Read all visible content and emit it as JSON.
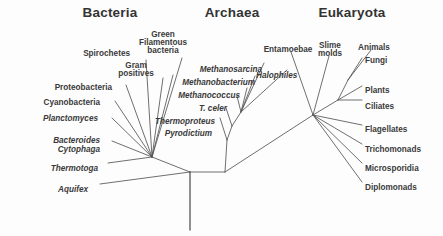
{
  "figure": {
    "kind": "phylogenetic-tree",
    "title_absent": true,
    "line_color": "#555555",
    "text_color": "#3a3a3a",
    "background": "#fdfdfd"
  },
  "headers": [
    {
      "label": "Bacteria",
      "x": 110,
      "y": 6
    },
    {
      "label": "Archaea",
      "x": 232,
      "y": 6
    },
    {
      "label": "Eukaryota",
      "x": 352,
      "y": 6
    }
  ],
  "domains": {
    "bacteria": {
      "name": "Bacteria",
      "leaves": [
        {
          "label": "Spirochetes",
          "italic": false,
          "align": "right",
          "x": 130,
          "y": 50
        },
        {
          "label": "Green",
          "italic": false,
          "align": "center",
          "x": 163,
          "y": 31
        },
        {
          "label": "Filamentous",
          "italic": false,
          "align": "center",
          "x": 163,
          "y": 39
        },
        {
          "label": "bacteria",
          "italic": false,
          "align": "center",
          "x": 163,
          "y": 47
        },
        {
          "label": "Gram",
          "italic": false,
          "align": "center",
          "x": 136,
          "y": 62
        },
        {
          "label": "positives",
          "italic": false,
          "align": "center",
          "x": 136,
          "y": 70
        },
        {
          "label": "Proteobacteria",
          "italic": false,
          "align": "right",
          "x": 112,
          "y": 84
        },
        {
          "label": "Cyanobacteria",
          "italic": false,
          "align": "right",
          "x": 100,
          "y": 99
        },
        {
          "label": "Planctomyces",
          "italic": true,
          "align": "right",
          "x": 98,
          "y": 115
        },
        {
          "label": "Bacteroides",
          "italic": true,
          "align": "right",
          "x": 100,
          "y": 137
        },
        {
          "label": "Cytophaga",
          "italic": true,
          "align": "right",
          "x": 100,
          "y": 146
        },
        {
          "label": "Thermotoga",
          "italic": true,
          "align": "right",
          "x": 98,
          "y": 165
        },
        {
          "label": "Aquifex",
          "italic": true,
          "align": "right",
          "x": 88,
          "y": 186
        }
      ]
    },
    "archaea": {
      "name": "Archaea",
      "leaves": [
        {
          "label": "Methanosarcina",
          "italic": true,
          "align": "right",
          "x": 262,
          "y": 66
        },
        {
          "label": "Methanobacterium",
          "italic": true,
          "align": "right",
          "x": 255,
          "y": 79
        },
        {
          "label": "Methanococcus",
          "italic": true,
          "align": "right",
          "x": 240,
          "y": 92
        },
        {
          "label": "T. celer",
          "italic": true,
          "align": "right",
          "x": 227,
          "y": 105
        },
        {
          "label": "Thermoproteus",
          "italic": true,
          "align": "right",
          "x": 215,
          "y": 118
        },
        {
          "label": "Pyrodictium",
          "italic": true,
          "align": "right",
          "x": 212,
          "y": 130
        },
        {
          "label": "Halophiles",
          "italic": true,
          "align": "left",
          "x": 256,
          "y": 72
        }
      ]
    },
    "eukaryota": {
      "name": "Eukaryota",
      "leaves": [
        {
          "label": "Entamoebae",
          "italic": false,
          "align": "center",
          "x": 288,
          "y": 46
        },
        {
          "label": "Slime",
          "italic": false,
          "align": "center",
          "x": 330,
          "y": 42
        },
        {
          "label": "molds",
          "italic": false,
          "align": "center",
          "x": 330,
          "y": 50
        },
        {
          "label": "Animals",
          "italic": false,
          "align": "center",
          "x": 374,
          "y": 44
        },
        {
          "label": "Fungi",
          "italic": false,
          "align": "left",
          "x": 365,
          "y": 57
        },
        {
          "label": "Plants",
          "italic": false,
          "align": "left",
          "x": 365,
          "y": 87
        },
        {
          "label": "Ciliates",
          "italic": false,
          "align": "left",
          "x": 365,
          "y": 103
        },
        {
          "label": "Flagellates",
          "italic": false,
          "align": "left",
          "x": 365,
          "y": 126
        },
        {
          "label": "Trichomonads",
          "italic": false,
          "align": "left",
          "x": 365,
          "y": 146
        },
        {
          "label": "Microsporidia",
          "italic": false,
          "align": "left",
          "x": 365,
          "y": 165
        },
        {
          "label": "Diplomonads",
          "italic": false,
          "align": "left",
          "x": 365,
          "y": 184
        }
      ]
    }
  },
  "tree_geometry": {
    "root": {
      "x": 190,
      "y": 230,
      "top_y": 172
    },
    "nodes": {
      "root_split": {
        "x": 190,
        "y": 172
      },
      "bacteria_fan": {
        "x": 152,
        "y": 157
      },
      "archaea_base": {
        "x": 225,
        "y": 172
      },
      "archaea_fan": {
        "x": 227,
        "y": 140
      },
      "archaea_inner": {
        "x": 232,
        "y": 126
      },
      "archaea_upper": {
        "x": 241,
        "y": 112
      },
      "euk_fan": {
        "x": 313,
        "y": 115
      },
      "euk_crown": {
        "x": 338,
        "y": 100
      },
      "euk_crown_top": {
        "x": 348,
        "y": 80
      }
    },
    "edges": [
      {
        "from": [
          190,
          230
        ],
        "to": [
          190,
          172
        ],
        "name": "root-stem"
      },
      {
        "from": [
          190,
          172
        ],
        "to": [
          152,
          157
        ],
        "name": "bacteria-stem"
      },
      {
        "from": [
          190,
          172
        ],
        "to": [
          225,
          172
        ],
        "name": "archaea-eukaryota-stem"
      },
      {
        "from": [
          225,
          172
        ],
        "to": [
          227,
          140
        ],
        "name": "archaea-stem"
      },
      {
        "from": [
          225,
          172
        ],
        "to": [
          313,
          115
        ],
        "name": "eukaryota-stem"
      },
      {
        "from": [
          152,
          157
        ],
        "to": [
          182,
          58
        ],
        "name": "b-green-filamentous"
      },
      {
        "from": [
          152,
          157
        ],
        "to": [
          173,
          75
        ],
        "name": "b-gram-positives-a"
      },
      {
        "from": [
          152,
          157
        ],
        "to": [
          163,
          78
        ],
        "name": "b-gram-positives-b"
      },
      {
        "from": [
          152,
          157
        ],
        "to": [
          146,
          60
        ],
        "name": "b-spirochetes"
      },
      {
        "from": [
          152,
          157
        ],
        "to": [
          126,
          85
        ],
        "name": "b-proteobacteria"
      },
      {
        "from": [
          152,
          157
        ],
        "to": [
          115,
          101
        ],
        "name": "b-cyanobacteria"
      },
      {
        "from": [
          152,
          157
        ],
        "to": [
          112,
          118
        ],
        "name": "b-planctomyces"
      },
      {
        "from": [
          152,
          157
        ],
        "to": [
          112,
          141
        ],
        "name": "b-bacteroides-cytophaga"
      },
      {
        "from": [
          152,
          157
        ],
        "to": [
          108,
          163
        ],
        "name": "b-thermotoga"
      },
      {
        "from": [
          190,
          172
        ],
        "to": [
          100,
          184
        ],
        "name": "b-aquifex"
      },
      {
        "from": [
          227,
          140
        ],
        "to": [
          220,
          118
        ],
        "name": "a-pyrodictium"
      },
      {
        "from": [
          227,
          140
        ],
        "to": [
          232,
          126
        ],
        "name": "a-upper-stem"
      },
      {
        "from": [
          232,
          126
        ],
        "to": [
          226,
          108
        ],
        "name": "a-thermoproteus"
      },
      {
        "from": [
          232,
          126
        ],
        "to": [
          241,
          112
        ],
        "name": "a-crown-stem"
      },
      {
        "from": [
          241,
          112
        ],
        "to": [
          237,
          96
        ],
        "name": "a-t-celer"
      },
      {
        "from": [
          241,
          112
        ],
        "to": [
          247,
          88
        ],
        "name": "a-methanococcus"
      },
      {
        "from": [
          241,
          112
        ],
        "to": [
          255,
          76
        ],
        "name": "a-methanobacterium"
      },
      {
        "from": [
          241,
          112
        ],
        "to": [
          264,
          63
        ],
        "name": "a-methanosarcina"
      },
      {
        "from": [
          241,
          112
        ],
        "to": [
          287,
          70
        ],
        "name": "a-halophiles"
      },
      {
        "from": [
          313,
          115
        ],
        "to": [
          291,
          52
        ],
        "name": "e-entamoebae"
      },
      {
        "from": [
          313,
          115
        ],
        "to": [
          329,
          56
        ],
        "name": "e-slime-molds"
      },
      {
        "from": [
          313,
          115
        ],
        "to": [
          338,
          100
        ],
        "name": "e-crown-stem"
      },
      {
        "from": [
          338,
          100
        ],
        "to": [
          362,
          100
        ],
        "name": "e-ciliates"
      },
      {
        "from": [
          338,
          100
        ],
        "to": [
          362,
          86
        ],
        "name": "e-plants"
      },
      {
        "from": [
          338,
          100
        ],
        "to": [
          348,
          80
        ],
        "name": "e-crown-top-stem"
      },
      {
        "from": [
          348,
          80
        ],
        "to": [
          362,
          58
        ],
        "name": "e-fungi"
      },
      {
        "from": [
          348,
          80
        ],
        "to": [
          371,
          50
        ],
        "name": "e-animals"
      },
      {
        "from": [
          313,
          115
        ],
        "to": [
          362,
          125
        ],
        "name": "e-flagellates"
      },
      {
        "from": [
          313,
          115
        ],
        "to": [
          362,
          144
        ],
        "name": "e-trichomonads"
      },
      {
        "from": [
          313,
          115
        ],
        "to": [
          362,
          163
        ],
        "name": "e-microsporidia"
      },
      {
        "from": [
          313,
          115
        ],
        "to": [
          362,
          182
        ],
        "name": "e-diplomonads"
      }
    ]
  }
}
